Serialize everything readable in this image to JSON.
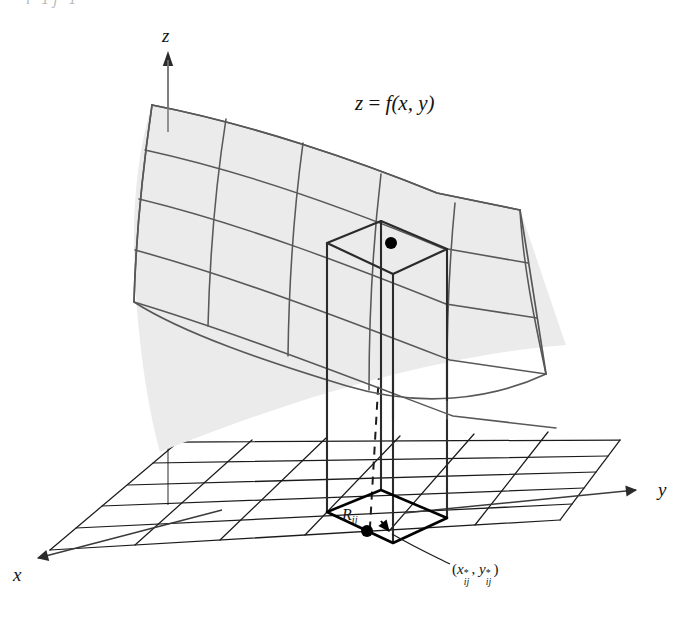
{
  "figure": {
    "background_color": "#ffffff",
    "width": 687,
    "height": 625
  },
  "axes": {
    "z_label": "z",
    "y_label": "y",
    "x_label": "x",
    "z_axis": {
      "from": [
        168,
        390
      ],
      "to": [
        168,
        52
      ],
      "arrow": "up"
    },
    "y_axis": {
      "from": [
        404,
        512
      ],
      "to": [
        643,
        489
      ],
      "arrow": "right"
    },
    "x_axis": {
      "from": [
        214,
        515
      ],
      "to": [
        33,
        562
      ],
      "arrow": "down-left"
    }
  },
  "labels": {
    "surface_equation": {
      "prefix": "z",
      "equals": "=",
      "fn": "f",
      "args": "(x, y)",
      "full": "z = f(x, y)"
    },
    "rectangle": {
      "base": "R",
      "sub": "ij",
      "full": "Rij"
    },
    "sample_point": {
      "full": "(x*ij, y*ij)",
      "x_base": "x",
      "y_base": "y",
      "sub": "ij",
      "star": "*"
    },
    "cropped_top": "i=1  j=1"
  },
  "colors": {
    "surface_fill": "#eaeaea",
    "surface_line": "#585858",
    "grid_line": "#1b1b1b",
    "box_line": "#2b2b2b",
    "dashed_line": "#1b1b1b",
    "dot_fill": "#000000",
    "axis_line": "#3a3a3a",
    "text": "#141414"
  },
  "geometry": {
    "base_grid": {
      "columns": 6,
      "rows": 5,
      "corner_near": [
        50,
        550
      ],
      "corner_left": [
        178,
        442
      ],
      "corner_right": [
        560,
        520
      ],
      "corner_far": [
        430,
        432
      ]
    },
    "surface": {
      "columns": 5,
      "rows": 4,
      "corner_top_left": [
        152,
        105
      ],
      "corner_top_right": [
        520,
        210
      ],
      "description": "curved quadrilateral mesh patch, saddle-like, concave downward"
    },
    "column_box": {
      "base_rect_corners": [
        [
          327,
          512
        ],
        [
          393,
          543
        ],
        [
          447,
          518
        ],
        [
          381,
          490
        ]
      ],
      "top_rect_corners": [
        [
          327,
          243
        ],
        [
          393,
          274
        ],
        [
          447,
          249
        ],
        [
          381,
          221
        ]
      ],
      "height_px": 269,
      "highlighted": true
    },
    "dot_top": [
      391,
      243
    ],
    "dot_base": [
      367,
      531
    ],
    "dashed_vertical": {
      "from": [
        385,
        252
      ],
      "to": [
        385,
        533
      ]
    }
  }
}
